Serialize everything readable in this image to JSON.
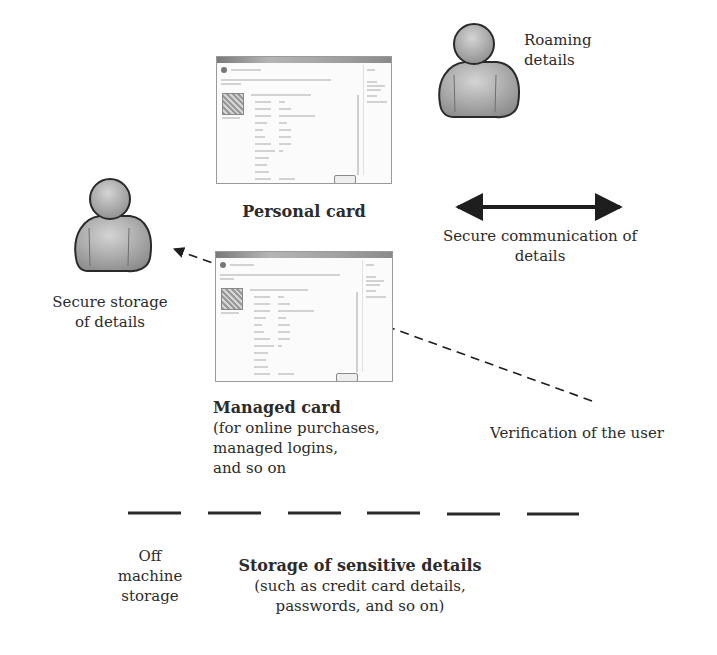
{
  "diagram": {
    "actors": {
      "roaming": {
        "label_line1": "Roaming",
        "label_line2": "details",
        "icon": "person-icon"
      },
      "secure_storage": {
        "label_line1": "Secure storage",
        "label_line2": "of details",
        "icon": "person-icon"
      }
    },
    "cards": {
      "personal": {
        "title": "Personal card"
      },
      "managed": {
        "title": "Managed card",
        "desc_line1": "(for online purchases,",
        "desc_line2": "managed logins,",
        "desc_line3": "and so on"
      }
    },
    "connectors": {
      "secure_comm": {
        "label_line1": "Secure communication of",
        "label_line2": "details",
        "style": "double-headed-solid-arrow"
      },
      "verification": {
        "label": "Verification of the user",
        "style": "dashed-arrow"
      },
      "boundary": {
        "style": "dashed-line"
      }
    },
    "bottom": {
      "off_machine": {
        "line1": "Off",
        "line2": "machine",
        "line3": "storage"
      },
      "sensitive": {
        "title": "Storage of sensitive details",
        "line1": "(such as credit card details,",
        "line2": "passwords, and so on)"
      }
    },
    "colors": {
      "person_fill": "#a9a9a9",
      "person_stroke": "#2a2a2a",
      "arrow": "#1e1e1e",
      "text": "#2b2b2b"
    }
  }
}
